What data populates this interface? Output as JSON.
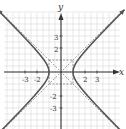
{
  "chart_data": {
    "type": "line",
    "title": "",
    "xlabel": "x",
    "ylabel": "y",
    "xlim": [
      -4.5,
      4.8
    ],
    "ylim": [
      -4.7,
      5
    ],
    "grid": true,
    "x_ticks": [
      -3,
      -2,
      2,
      3
    ],
    "y_ticks": [
      3,
      2,
      -2,
      -3
    ],
    "series": [
      {
        "name": "hyperbola x^2 - y^2 = 1",
        "style": "solid",
        "equation": "x^2 - y^2 = 1"
      },
      {
        "name": "asymptote y = x",
        "style": "dashed"
      },
      {
        "name": "asymptote y = -x",
        "style": "dashed"
      },
      {
        "name": "fundamental rectangle",
        "style": "dashed",
        "x": [
          -1,
          1
        ],
        "y": [
          -1,
          1
        ]
      }
    ]
  },
  "labels": {
    "x_axis": "x",
    "y_axis": "y",
    "xt": [
      "-3",
      "-2",
      "2",
      "3"
    ],
    "yt": [
      "3",
      "2",
      "-2",
      "-3"
    ]
  },
  "colors": {
    "curve": "#555555",
    "grid": "#d8d8d8",
    "axis": "#333333",
    "dash": "#777777"
  }
}
